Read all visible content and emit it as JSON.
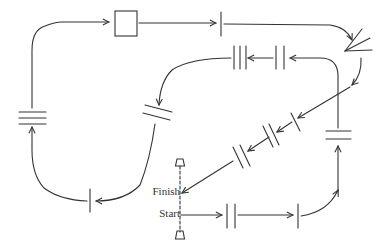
{
  "diagram": {
    "type": "course-map",
    "labels": {
      "finish": "Finish",
      "start": "Start"
    },
    "colors": {
      "stroke": "#333333",
      "background": "#ffffff"
    },
    "obstacles": [
      {
        "id": "double-vertical-1",
        "kind": "double-bar-vertical",
        "note": "first obstacle after start"
      },
      {
        "id": "single-vertical-1",
        "kind": "single-bar-vertical"
      },
      {
        "id": "double-horizontal-1",
        "kind": "double-bar-horizontal"
      },
      {
        "id": "double-vertical-2",
        "kind": "double-bar-vertical"
      },
      {
        "id": "triple-vertical-1",
        "kind": "triple-bar-vertical"
      },
      {
        "id": "double-diagonal-1",
        "kind": "double-bar-diagonal"
      },
      {
        "id": "single-vertical-2",
        "kind": "single-bar-vertical"
      },
      {
        "id": "triple-horizontal-1",
        "kind": "triple-bar-horizontal"
      },
      {
        "id": "box-1",
        "kind": "square-box"
      },
      {
        "id": "single-vertical-3",
        "kind": "single-bar-vertical"
      },
      {
        "id": "fan-1",
        "kind": "fan"
      },
      {
        "id": "single-diagonal-1",
        "kind": "single-bar-diagonal"
      },
      {
        "id": "double-diagonal-2",
        "kind": "double-bar-diagonal"
      },
      {
        "id": "double-diagonal-3",
        "kind": "double-bar-diagonal"
      }
    ],
    "start_finish_line": {
      "style": "dashed",
      "cones": 2
    }
  }
}
